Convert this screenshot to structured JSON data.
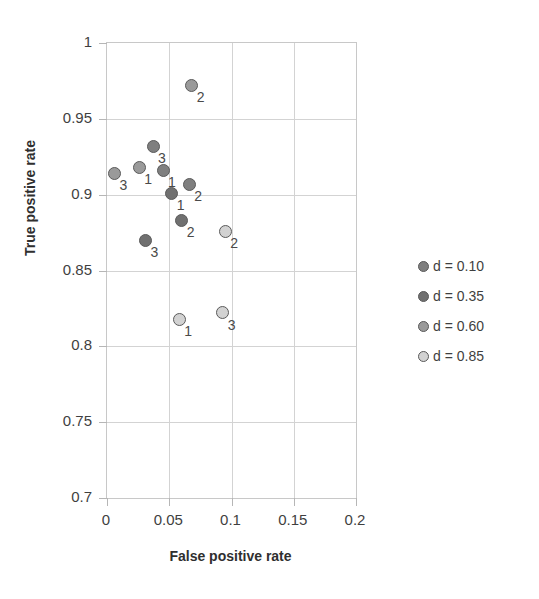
{
  "chart_data": {
    "type": "scatter",
    "title": "",
    "xlabel": "False positive rate",
    "ylabel": "True positive rate",
    "xlim": [
      0,
      0.2
    ],
    "ylim": [
      0.7,
      1
    ],
    "xticks": [
      "0",
      "0.05",
      "0.1",
      "0.15",
      "0.2"
    ],
    "xtick_values": [
      0,
      0.05,
      0.1,
      0.15,
      0.2
    ],
    "yticks": [
      "0.7",
      "0.75",
      "0.8",
      "0.85",
      "0.9",
      "0.95",
      "1"
    ],
    "ytick_values": [
      0.7,
      0.75,
      0.8,
      0.85,
      0.9,
      0.95,
      1
    ],
    "grid": true,
    "legend_position": "right",
    "series": [
      {
        "name": "d = 0.10",
        "color": "#7f7f7f",
        "points": [
          {
            "x": 0.037,
            "y": 0.932,
            "label": "3"
          },
          {
            "x": 0.045,
            "y": 0.916,
            "label": "1"
          },
          {
            "x": 0.066,
            "y": 0.907,
            "label": "2"
          }
        ]
      },
      {
        "name": "d = 0.35",
        "color": "#707070",
        "points": [
          {
            "x": 0.052,
            "y": 0.901,
            "label": "1"
          },
          {
            "x": 0.06,
            "y": 0.883,
            "label": "2"
          },
          {
            "x": 0.031,
            "y": 0.87,
            "label": "3"
          }
        ]
      },
      {
        "name": "d = 0.60",
        "color": "#9a9a9a",
        "points": [
          {
            "x": 0.026,
            "y": 0.918,
            "label": "1"
          },
          {
            "x": 0.068,
            "y": 0.972,
            "label": "2"
          },
          {
            "x": 0.006,
            "y": 0.914,
            "label": "3"
          }
        ]
      },
      {
        "name": "d = 0.85",
        "color": "#d2d2d2",
        "points": [
          {
            "x": 0.058,
            "y": 0.818,
            "label": "1"
          },
          {
            "x": 0.095,
            "y": 0.876,
            "label": "2"
          },
          {
            "x": 0.093,
            "y": 0.822,
            "label": "3"
          }
        ]
      }
    ]
  },
  "legend": {
    "items": [
      {
        "label": "d = 0.10",
        "color": "#7f7f7f"
      },
      {
        "label": "d = 0.35",
        "color": "#707070"
      },
      {
        "label": "d = 0.60",
        "color": "#9a9a9a"
      },
      {
        "label": "d = 0.85",
        "color": "#d2d2d2"
      }
    ]
  },
  "axes": {
    "x_title": "False positive rate",
    "y_title": "True positive rate"
  },
  "colors": {
    "grid": "#d3d3d3",
    "frame": "#c8c8c8",
    "text": "#3f3f3f",
    "marker_outline": "#5a5a5a"
  }
}
